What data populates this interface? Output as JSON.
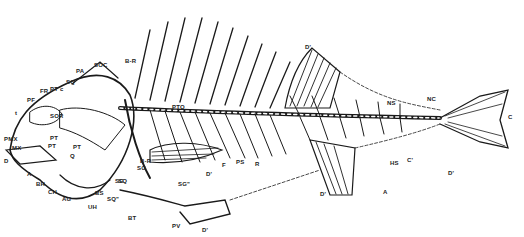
{
  "diagram": {
    "colors": {
      "ink": "#1a1a1a",
      "background": "#ffffff"
    },
    "labels": [
      {
        "id": "soc",
        "text": "SOC",
        "x": 94,
        "y": 62
      },
      {
        "id": "br",
        "text": "B-R",
        "x": 125,
        "y": 58
      },
      {
        "id": "pa",
        "text": "PA",
        "x": 76,
        "y": 68
      },
      {
        "id": "sq",
        "text": "SQ",
        "x": 66,
        "y": 79
      },
      {
        "id": "ptc",
        "text": "PT c",
        "x": 50,
        "y": 86
      },
      {
        "id": "fr",
        "text": "FR",
        "x": 40,
        "y": 88
      },
      {
        "id": "pf",
        "text": "PF",
        "x": 27,
        "y": 97
      },
      {
        "id": "t",
        "text": "t",
        "x": 15,
        "y": 110
      },
      {
        "id": "sor",
        "text": "SOR",
        "x": 50,
        "y": 113
      },
      {
        "id": "pmx",
        "text": "PMX",
        "x": 4,
        "y": 136
      },
      {
        "id": "mx",
        "text": "MX",
        "x": 12,
        "y": 145
      },
      {
        "id": "pt1",
        "text": "PT",
        "x": 50,
        "y": 135
      },
      {
        "id": "pt2",
        "text": "PT",
        "x": 48,
        "y": 143
      },
      {
        "id": "q",
        "text": "Q",
        "x": 70,
        "y": 153
      },
      {
        "id": "d_jaw",
        "text": "D",
        "x": 4,
        "y": 158
      },
      {
        "id": "a",
        "text": "A",
        "x": 27,
        "y": 171
      },
      {
        "id": "bh",
        "text": "BH",
        "x": 36,
        "y": 181
      },
      {
        "id": "ch",
        "text": "CH",
        "x": 48,
        "y": 189
      },
      {
        "id": "ag",
        "text": "AG",
        "x": 62,
        "y": 196
      },
      {
        "id": "bs",
        "text": "BS",
        "x": 95,
        "y": 190
      },
      {
        "id": "uh",
        "text": "UH",
        "x": 88,
        "y": 204
      },
      {
        "id": "sq2",
        "text": "SQ\"",
        "x": 107,
        "y": 196
      },
      {
        "id": "pt_c",
        "text": "PT",
        "x": 73,
        "y": 144
      },
      {
        "id": "sq3",
        "text": "SQ",
        "x": 118,
        "y": 178
      },
      {
        "id": "sg",
        "text": "SG",
        "x": 115,
        "y": 178
      },
      {
        "id": "br2",
        "text": "B-R",
        "x": 140,
        "y": 158
      },
      {
        "id": "sg2",
        "text": "SG",
        "x": 137,
        "y": 165
      },
      {
        "id": "sg3",
        "text": "SG\"",
        "x": 178,
        "y": 181
      },
      {
        "id": "pto",
        "text": "PTO",
        "x": 172,
        "y": 104
      },
      {
        "id": "f",
        "text": "F",
        "x": 222,
        "y": 162
      },
      {
        "id": "d_pect",
        "text": "D'",
        "x": 206,
        "y": 171
      },
      {
        "id": "ps",
        "text": "PS",
        "x": 236,
        "y": 159
      },
      {
        "id": "r",
        "text": "R",
        "x": 255,
        "y": 161
      },
      {
        "id": "bt",
        "text": "BT",
        "x": 128,
        "y": 215
      },
      {
        "id": "pv",
        "text": "PV",
        "x": 172,
        "y": 223
      },
      {
        "id": "d_pelv",
        "text": "D'",
        "x": 202,
        "y": 227
      },
      {
        "id": "d_dorsal",
        "text": "D'",
        "x": 305,
        "y": 44
      },
      {
        "id": "ns",
        "text": "NS",
        "x": 387,
        "y": 100
      },
      {
        "id": "nc",
        "text": "NC",
        "x": 427,
        "y": 96
      },
      {
        "id": "c",
        "text": "C",
        "x": 508,
        "y": 114
      },
      {
        "id": "hs",
        "text": "HS",
        "x": 390,
        "y": 160
      },
      {
        "id": "c2",
        "text": "C'",
        "x": 407,
        "y": 157
      },
      {
        "id": "d_anal",
        "text": "D'",
        "x": 320,
        "y": 191
      },
      {
        "id": "a_anal",
        "text": "A",
        "x": 383,
        "y": 189
      },
      {
        "id": "d_tail",
        "text": "D'",
        "x": 448,
        "y": 170
      }
    ]
  }
}
